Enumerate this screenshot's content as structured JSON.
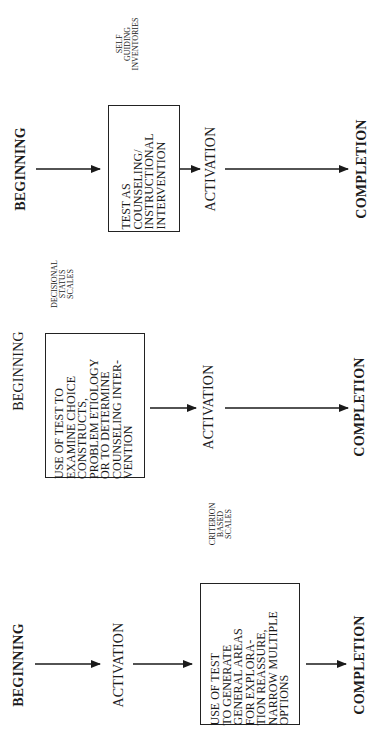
{
  "diagram": {
    "orientation": "rotated 90 degrees counterclockwise",
    "panels": [
      {
        "id": "self-guiding",
        "side_label": "SELF\nGUIDING\nINVENTORIES",
        "steps": [
          "BEGINNING",
          "ACTIVATION",
          "COMPLETION"
        ],
        "box_text": "TEST AS\nCOUNSELING/\nINSTRUCTIONAL\nINTERVENTION",
        "box_position": "between BEGINNING and ACTIVATION"
      },
      {
        "id": "decisional-status",
        "side_label": "DECISIONAL\nSTATUS\nSCALES",
        "steps": [
          "BEGINNING",
          "ACTIVATION",
          "COMPLETION"
        ],
        "box_text": "USE OF TEST TO\nEXAMINE CHOICE\nCONSTRUCTS,\nPROBLEM ETIOLOGY\nOR TO DETERMINE\nCOUNSELING INTER-\nVENTION",
        "box_position": "between BEGINNING and ACTIVATION"
      },
      {
        "id": "criterion-based",
        "side_label": "CRITERION\nBASED\nSCALES",
        "steps": [
          "BEGINNING",
          "ACTIVATION",
          "COMPLETION"
        ],
        "box_text": "USE OF TEST\nTO GENERATE\nGENERAL AREAS\nFOR EXPLORA-\nTION REASSURE,\nNARROW MULTIPLE\nOPTIONS",
        "box_position": "between ACTIVATION and COMPLETION"
      }
    ]
  },
  "colors": {
    "ink": "#1a1a1a",
    "background": "#ffffff"
  }
}
